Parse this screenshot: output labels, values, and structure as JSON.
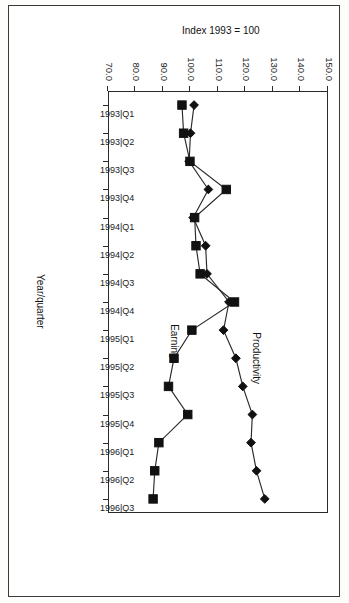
{
  "chart_data": {
    "type": "line",
    "title": "",
    "xlabel": "Year/quarter",
    "ylabel": "Index 1993 = 100",
    "categories": [
      "1993|Q1",
      "1993|Q2",
      "1993|Q3",
      "1993|Q4",
      "1994|Q1",
      "1994|Q2",
      "1994|Q3",
      "1994|Q4",
      "1995|Q1",
      "1995|Q2",
      "1995|Q3",
      "1995|Q4",
      "1996|Q1",
      "1996|Q2",
      "1996|Q3"
    ],
    "ytick_labels": [
      "150.0",
      "140.0",
      "130.0",
      "120.0",
      "110.0",
      "100.0",
      "90.0",
      "80.0",
      "70.0"
    ],
    "ytick_values": [
      150,
      140,
      130,
      120,
      110,
      100,
      90,
      80,
      70
    ],
    "ylim": [
      70,
      150
    ],
    "y_axis_inverted": true,
    "grid": false,
    "legend": "inline-labels",
    "series": [
      {
        "name": "Productivity",
        "marker": "diamond",
        "values": [
          101.3,
          100.0,
          99.5,
          106.5,
          101.0,
          105.5,
          106.0,
          114.0,
          112.0,
          116.5,
          119.0,
          122.5,
          122.0,
          124.0,
          127.0
        ]
      },
      {
        "name": "Earnings",
        "marker": "square",
        "values": [
          96.9,
          97.5,
          99.8,
          113.0,
          101.5,
          102.0,
          103.5,
          116.0,
          100.5,
          94.0,
          92.0,
          99.0,
          88.5,
          87.0,
          86.4
        ]
      }
    ],
    "annotations": [
      {
        "text": "Productivity",
        "near_category": "1995|Q2"
      },
      {
        "text": "Earnings",
        "near_category": "1995|Q1"
      }
    ]
  },
  "axis": {
    "x_title": "Year/quarter",
    "y_title": "Index 1993 = 100"
  }
}
